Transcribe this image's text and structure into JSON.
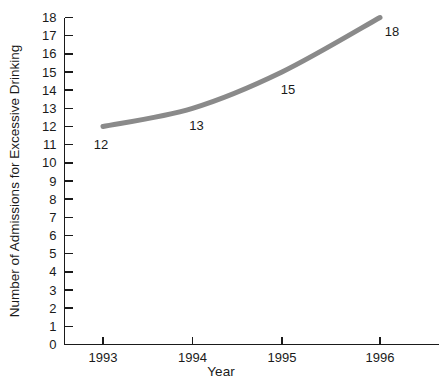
{
  "chart_data": {
    "type": "line",
    "title": "",
    "subtitle": "",
    "xlabel": "Year",
    "ylabel": "Number of Admissions for Excessive Drinking",
    "categories": [
      "1993",
      "1994",
      "1995",
      "1996"
    ],
    "x": [
      1993,
      1994,
      1995,
      1996
    ],
    "values": [
      12,
      13,
      15,
      18
    ],
    "point_labels": [
      "12",
      "13",
      "15",
      "18"
    ],
    "series": [
      {
        "name": "Admissions for Excessive Drinking",
        "values": [
          12,
          13,
          15,
          18
        ],
        "color": "#8a8a8a"
      }
    ],
    "ylim": [
      0,
      18
    ],
    "xlim": [
      1993,
      1996
    ],
    "y_ticks": [
      0,
      1,
      2,
      3,
      4,
      5,
      6,
      7,
      8,
      9,
      10,
      11,
      12,
      13,
      14,
      15,
      16,
      17,
      18
    ],
    "y_tick_labels": [
      "0",
      "1",
      "2",
      "3",
      "4",
      "5",
      "6",
      "7",
      "8",
      "9",
      "10",
      "11",
      "12",
      "13",
      "14",
      "15",
      "16",
      "17",
      "18"
    ],
    "x_ticks": [
      1993,
      1994,
      1995,
      1996
    ],
    "x_tick_labels": [
      "1993",
      "1994",
      "1995",
      "1996"
    ],
    "grid": false,
    "legend": false,
    "legend_position": "none",
    "line_width": 5,
    "line_color": "#8a8a8a",
    "axis_color": "#1a1a1a",
    "background_color": "#ffffff"
  },
  "axes": {
    "y_title": "Number of Admissions for Excessive Drinking",
    "x_title": "Year"
  }
}
